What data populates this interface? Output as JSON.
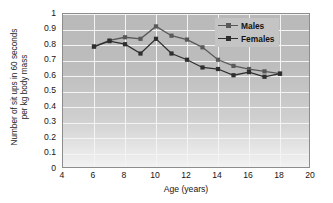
{
  "chart_data": {
    "type": "line",
    "title": "",
    "xlabel": "Age (years)",
    "ylabel": "Number of sit ups in 60 seconds\nper kg body mass",
    "xlim": [
      4,
      20
    ],
    "ylim": [
      0,
      1
    ],
    "xticks": [
      "4",
      "6",
      "8",
      "10",
      "12",
      "14",
      "16",
      "18",
      "20"
    ],
    "xtick_values": [
      4,
      6,
      8,
      10,
      12,
      14,
      16,
      18,
      20
    ],
    "yticks": [
      "0",
      "0.1",
      "0.2",
      "0.3",
      "0.4",
      "0.5",
      "0.6",
      "0.7",
      "0.8",
      "0.9",
      "1"
    ],
    "ytick_values": [
      0,
      0.1,
      0.2,
      0.3,
      0.4,
      0.5,
      0.6,
      0.7,
      0.8,
      0.9,
      1
    ],
    "grid": true,
    "legend_position": "top-right",
    "x": [
      6,
      7,
      8,
      9,
      10,
      11,
      12,
      13,
      14,
      15,
      16,
      17,
      18
    ],
    "series": [
      {
        "name": "Males",
        "color": "#595959",
        "marker": "square",
        "values": [
          0.79,
          0.83,
          0.85,
          0.84,
          0.92,
          0.86,
          0.835,
          0.785,
          0.705,
          0.665,
          0.645,
          0.63,
          0.615
        ]
      },
      {
        "name": "Females",
        "color": "#2e2e2e",
        "marker": "square",
        "values": [
          0.79,
          0.825,
          0.805,
          0.745,
          0.84,
          0.745,
          0.705,
          0.655,
          0.645,
          0.605,
          0.625,
          0.595,
          0.615
        ]
      }
    ]
  },
  "legend": {
    "entries": [
      {
        "label": "Males"
      },
      {
        "label": "Females"
      }
    ]
  },
  "colors": {
    "males": "#595959",
    "females": "#2e2e2e",
    "plot_background": "#c0c0c0",
    "gridline": "#f4f4f4",
    "axis": "#8d8d8d",
    "text": "#151515"
  }
}
